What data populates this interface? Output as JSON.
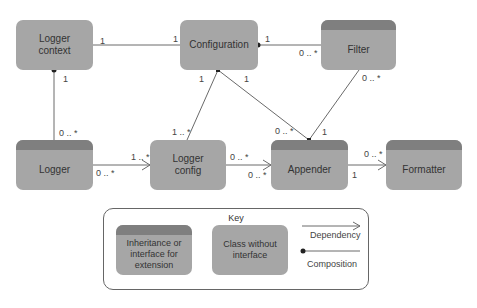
{
  "classes": {
    "logger_context": "Logger context",
    "configuration": "Configuration",
    "filter": "Filter",
    "logger": "Logger",
    "logger_config": "Logger config",
    "appender": "Appender",
    "formatter": "Formatter"
  },
  "multiplicities": {
    "lc_conf_left": "1",
    "lc_conf_right": "1",
    "conf_filter_left": "1",
    "conf_filter_right": "0 .. *",
    "lc_logger_top": "1",
    "lc_logger_bottom": "0 .. *",
    "conf_lcfg_top": "1",
    "conf_lcfg_bottom": "1 .. *",
    "conf_app_top": "1",
    "conf_app_bottom": "0 .. *",
    "filter_app_top": "0 .. *",
    "filter_app_bottom": "1",
    "logger_lcfg_left": "0 .. *",
    "logger_lcfg_right": "1 .. *",
    "lcfg_app_left": "0 .. *",
    "lcfg_app_right": "0 .. *",
    "app_fmt_left": "1",
    "app_fmt_right": "0 .. *"
  },
  "key": {
    "title": "Key",
    "inheritance": "Inheritance or interface for extension",
    "class_without": "Class without interface",
    "dependency": "Dependency",
    "composition": "Composition"
  },
  "colors": {
    "box": "#a6a6a6",
    "header": "#7f7f7f",
    "line": "#555555"
  }
}
